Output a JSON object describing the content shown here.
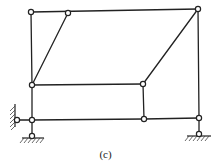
{
  "figure": {
    "caption": "(c)",
    "colors": {
      "line": "#222222",
      "background": "#ffffff"
    },
    "nodes": [
      {
        "id": "A",
        "x": 31,
        "y": 12,
        "type": "hinge"
      },
      {
        "id": "B",
        "x": 68,
        "y": 13,
        "type": "hinge"
      },
      {
        "id": "C",
        "x": 198,
        "y": 9,
        "type": "hinge"
      },
      {
        "id": "D",
        "x": 32,
        "y": 85,
        "type": "hinge"
      },
      {
        "id": "E",
        "x": 143,
        "y": 84,
        "type": "hinge"
      },
      {
        "id": "F",
        "x": 32,
        "y": 120,
        "type": "hinge"
      },
      {
        "id": "G",
        "x": 144,
        "y": 119,
        "type": "hinge"
      },
      {
        "id": "H",
        "x": 199,
        "y": 118,
        "type": "hinge"
      },
      {
        "id": "W",
        "x": 17,
        "y": 120,
        "type": "wall-hinge"
      },
      {
        "id": "S1",
        "x": 32,
        "y": 136,
        "type": "ground-pin"
      },
      {
        "id": "S2",
        "x": 199,
        "y": 134,
        "type": "ground-pin"
      }
    ],
    "members": [
      [
        "A",
        "C"
      ],
      [
        "A",
        "D"
      ],
      [
        "B",
        "D"
      ],
      [
        "C",
        "E"
      ],
      [
        "C",
        "H"
      ],
      [
        "D",
        "E"
      ],
      [
        "D",
        "F"
      ],
      [
        "E",
        "G"
      ],
      [
        "F",
        "G"
      ],
      [
        "G",
        "H"
      ],
      [
        "W",
        "F"
      ],
      [
        "F",
        "S1"
      ],
      [
        "H",
        "S2"
      ]
    ]
  }
}
